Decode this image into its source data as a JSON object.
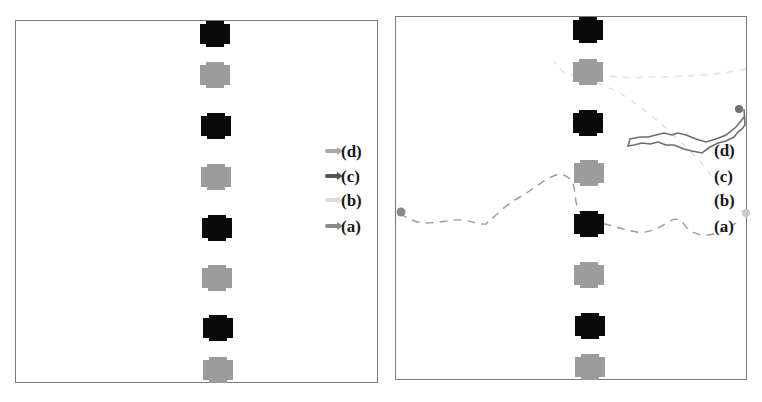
{
  "figure": {
    "panels": [
      {
        "id": "left",
        "description": "initial state with start markers",
        "obstacles": [
          {
            "color": "black"
          },
          {
            "color": "grey"
          },
          {
            "color": "black"
          },
          {
            "color": "grey"
          },
          {
            "color": "black"
          },
          {
            "color": "grey"
          },
          {
            "color": "black"
          },
          {
            "color": "grey"
          }
        ],
        "markers": [
          {
            "label": "(d)",
            "color": "#a8a8a8"
          },
          {
            "label": "(c)",
            "color": "#555555"
          },
          {
            "label": "(b)",
            "color": "#dcdcdc"
          },
          {
            "label": "(a)",
            "color": "#8a8a8a"
          }
        ]
      },
      {
        "id": "right",
        "description": "trajectories",
        "obstacles": [
          {
            "color": "black"
          },
          {
            "color": "grey"
          },
          {
            "color": "black"
          },
          {
            "color": "grey"
          },
          {
            "color": "black"
          },
          {
            "color": "grey"
          },
          {
            "color": "black"
          },
          {
            "color": "grey"
          }
        ],
        "labels": [
          "(d)",
          "(c)",
          "(b)",
          "(a)"
        ],
        "trajectories": [
          {
            "label": "(a)",
            "style": "dashed",
            "color": "#9a9a9a"
          },
          {
            "label": "(b)",
            "style": "dashed",
            "color": "#dadada"
          },
          {
            "label": "(c)",
            "style": "solid",
            "color": "#6e6e6e"
          },
          {
            "label": "(d)",
            "style": "dashed",
            "color": "#e2e2e2"
          }
        ]
      }
    ]
  },
  "colors": {
    "obstacle_black": "#0a0a0a",
    "obstacle_grey": "#9c9c9c",
    "border": "#7a7a7a"
  }
}
